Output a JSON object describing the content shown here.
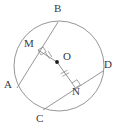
{
  "figure": {
    "canvas": {
      "width": 121,
      "height": 134,
      "background": "#ffffff"
    },
    "stroke_color": "#8a8a8a",
    "label_color": "#3a3a3a",
    "center_dot_color": "#1a1a1a",
    "circle": {
      "cx": 59,
      "cy": 66,
      "r": 45
    },
    "center_point": {
      "name": "O",
      "x": 57,
      "y": 62
    },
    "labels": {
      "B": "B",
      "M": "M",
      "O": "O",
      "D": "D",
      "A": "A",
      "N": "N",
      "C": "C"
    },
    "points": [
      {
        "name": "B",
        "x": 58,
        "y": 22
      },
      {
        "name": "A",
        "x": 17,
        "y": 88
      },
      {
        "name": "D",
        "x": 103,
        "y": 71
      },
      {
        "name": "C",
        "x": 43,
        "y": 110
      },
      {
        "name": "M",
        "x": 38,
        "y": 50
      },
      {
        "name": "N",
        "x": 72,
        "y": 83
      }
    ],
    "chords": [
      {
        "name": "AB",
        "from": "A",
        "to": "B",
        "x1": 17,
        "y1": 88,
        "x2": 58,
        "y2": 22
      },
      {
        "name": "CD",
        "from": "C",
        "to": "D",
        "x1": 43,
        "y1": 110,
        "x2": 103,
        "y2": 71
      }
    ],
    "segments": [
      {
        "name": "OM",
        "from": "O",
        "to": "M",
        "x1": 57,
        "y1": 62,
        "x2": 38,
        "y2": 50,
        "ticks": 2
      },
      {
        "name": "ON",
        "from": "O",
        "to": "N",
        "x1": 57,
        "y1": 62,
        "x2": 72,
        "y2": 83,
        "ticks": 2
      }
    ],
    "right_angles": [
      {
        "name": "angle-at-M",
        "vertex": "M",
        "x": 38,
        "y": 50
      },
      {
        "name": "angle-at-N",
        "vertex": "N",
        "x": 72,
        "y": 83
      }
    ]
  }
}
